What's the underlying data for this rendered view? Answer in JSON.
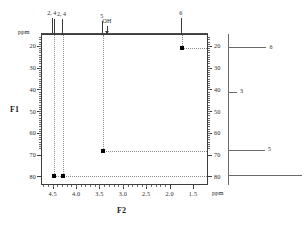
{
  "figure": {
    "type": "2d-nmr-correlation-spectrum",
    "f1_axis_label": "F1",
    "f2_axis_label": "F2",
    "ppm_caption": "ppm"
  },
  "chart_data": {
    "type": "scatter",
    "title": "",
    "xlabel": "F2",
    "ylabel": "F1",
    "xunit": "ppm",
    "yunit": "ppm",
    "grid": false,
    "legend": "none",
    "xlim": [
      4.75,
      1.18
    ],
    "ylim": [
      14.5,
      84.0
    ],
    "xticks": [
      "4.5",
      "4.0",
      "3.5",
      "3.0",
      "2.5",
      "2.0",
      "1.5"
    ],
    "xtick_values": [
      4.5,
      4.0,
      3.5,
      3.0,
      2.5,
      2.0,
      1.5
    ],
    "yticks": [
      "20",
      "30",
      "40",
      "50",
      "60",
      "70",
      "80"
    ],
    "ytick_values": [
      20,
      30,
      40,
      50,
      60,
      70,
      80
    ],
    "cross_peaks": [
      {
        "f2": 4.5,
        "f1": 79.3,
        "assignment": "2, 4"
      },
      {
        "f2": 4.31,
        "f1": 79.3,
        "assignment": "2, 4"
      },
      {
        "f2": 3.45,
        "f1": 67.8,
        "assignment": "5"
      },
      {
        "f2": 1.76,
        "f1": 20.5,
        "assignment": "6"
      }
    ],
    "f2_projection": {
      "axis": "top",
      "peaks": [
        {
          "position": 4.52,
          "height": 1.0,
          "label": "2, 4"
        },
        {
          "position": 4.47,
          "height": 0.92,
          "label": ""
        },
        {
          "position": 4.31,
          "height": 0.95,
          "label": "2, 4"
        },
        {
          "position": 3.45,
          "height": 0.8,
          "label": "5"
        },
        {
          "position": 3.34,
          "height": 0.3,
          "label": "OH"
        },
        {
          "position": 1.76,
          "height": 1.0,
          "label": "6"
        }
      ]
    },
    "f1_projection": {
      "axis": "right",
      "peaks": [
        {
          "position": 20.5,
          "height": 0.52,
          "label": "6"
        },
        {
          "position": 41.0,
          "height": 0.12,
          "label": "3"
        },
        {
          "position": 67.8,
          "height": 0.5,
          "label": "5"
        },
        {
          "position": 79.3,
          "height": 1.0,
          "label": "2, 4"
        }
      ]
    },
    "right_axis_ticks": [
      "20",
      "30",
      "40",
      "50",
      "60",
      "70",
      "80"
    ]
  }
}
